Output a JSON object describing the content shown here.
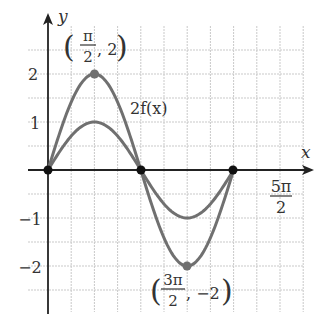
{
  "chart_data": {
    "type": "line",
    "title": "",
    "xlabel": "x",
    "ylabel": "y",
    "x_unit": "pi/4 per gridline",
    "xlim": [
      0,
      2.5
    ],
    "x_range_note": "x in multiples of pi, from 0 to 5π/2",
    "ylim": [
      -2.5,
      2.5
    ],
    "grid": true,
    "y_ticks": [
      {
        "value": 2,
        "label": "2"
      },
      {
        "value": 1,
        "label": "1"
      },
      {
        "value": -1,
        "label": "−1"
      },
      {
        "value": -2,
        "label": "−2"
      }
    ],
    "x_ticks": [
      {
        "value": 2.5,
        "label_num": "5π",
        "label_den": "2"
      }
    ],
    "series": [
      {
        "name": "f(x)",
        "function": "sin(x)",
        "amplitude": 1,
        "domain": [
          0,
          2
        ],
        "domain_unit": "pi"
      },
      {
        "name": "2f(x)",
        "function": "2 sin(x)",
        "amplitude": 2,
        "domain": [
          0,
          2
        ],
        "domain_unit": "pi"
      }
    ],
    "points": [
      {
        "x": 0,
        "y": 0,
        "style": "zero"
      },
      {
        "x": 1,
        "y": 0,
        "style": "zero"
      },
      {
        "x": 2,
        "y": 0,
        "style": "zero"
      },
      {
        "x": 0.5,
        "y": 2,
        "style": "extremum"
      },
      {
        "x": 1.5,
        "y": -2,
        "style": "extremum"
      }
    ],
    "annotations": [
      {
        "text_pre": "(",
        "num": "π",
        "den": "2",
        "text_post": ", 2)",
        "point": [
          0.5,
          2
        ]
      },
      {
        "text_pre": "(",
        "num": "3π",
        "den": "2",
        "text_post": ", −2)",
        "point": [
          1.5,
          -2
        ]
      },
      {
        "text": "2f(x)",
        "near_series": "2f(x)"
      }
    ]
  },
  "labels": {
    "x_axis": "x",
    "y_axis": "y",
    "y2": "2",
    "y1": "1",
    "ym1": "−1",
    "ym2": "−2",
    "x_tick_num": "5π",
    "x_tick_den": "2",
    "curve_label": "2f(x)",
    "peak_num": "π",
    "peak_den": "2",
    "peak_rest": ", 2",
    "min_num": "3π",
    "min_den": "2",
    "min_rest": ", −2",
    "open_paren": "(",
    "close_paren": ")"
  },
  "colors": {
    "curve": "#707070",
    "grid": "#c9c9c9",
    "axis": "#222222",
    "zero_point": "#111111",
    "extremum_point": "#707070"
  }
}
